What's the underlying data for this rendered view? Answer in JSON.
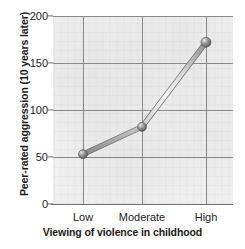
{
  "chart_data": {
    "type": "line",
    "title": "",
    "subtitle": "",
    "xlabel": "Viewing of violence in childhood",
    "ylabel": "Peer-rated aggression (10 years later)",
    "categories": [
      "Low",
      "Moderate",
      "High"
    ],
    "values": [
      53,
      82,
      172
    ],
    "series": [
      {
        "name": "Peer-rated aggression",
        "values": [
          53,
          82,
          172
        ]
      }
    ],
    "ylim": [
      0,
      200
    ],
    "yticks": [
      0,
      50,
      100,
      150,
      200
    ],
    "ytick_labels": [
      "0",
      "50",
      "100",
      "150",
      "200"
    ],
    "grid": "both",
    "legend": "none",
    "marker": "sphere",
    "line_color": "#9a9a9a",
    "marker_color": "#777777",
    "plot_background": "#efefef",
    "grid_color": "#8a8a8a",
    "axis_color": "#6e6e6e",
    "text_color": "#1b1b1b"
  }
}
